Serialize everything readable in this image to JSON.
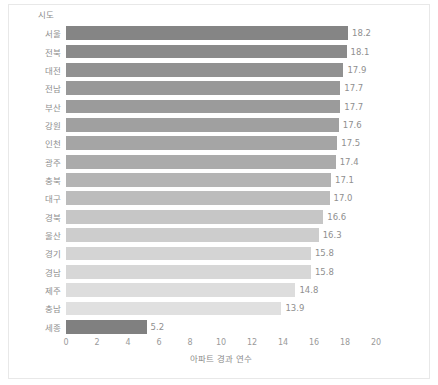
{
  "chart_data": {
    "type": "bar",
    "orientation": "horizontal",
    "title": "",
    "ylabel": "시도",
    "xlabel": "아파트 경과 연수",
    "xlim": [
      0,
      20
    ],
    "xticks": [
      0,
      2,
      4,
      6,
      8,
      10,
      12,
      14,
      16,
      18,
      20
    ],
    "xtick_labels": [
      "0",
      "2",
      "4",
      "6",
      "8",
      "10",
      "12",
      "14",
      "16",
      "18",
      "20"
    ],
    "grid": false,
    "legend": false,
    "categories": [
      "서울",
      "전북",
      "대전",
      "전남",
      "부산",
      "강원",
      "인천",
      "광주",
      "충북",
      "대구",
      "경북",
      "울산",
      "경기",
      "경남",
      "제주",
      "충남",
      "세종"
    ],
    "values": [
      18.2,
      18.1,
      17.9,
      17.7,
      17.7,
      17.6,
      17.5,
      17.4,
      17.1,
      17.0,
      16.6,
      16.3,
      15.8,
      15.8,
      14.8,
      13.9,
      5.2
    ],
    "value_labels": [
      "18.2",
      "18.1",
      "17.9",
      "17.7",
      "17.7",
      "17.6",
      "17.5",
      "17.4",
      "17.1",
      "17.0",
      "16.6",
      "16.3",
      "15.8",
      "15.8",
      "14.8",
      "13.9",
      "5.2"
    ],
    "bar_colors": [
      "#858585",
      "#8a8a8a",
      "#919191",
      "#989898",
      "#9b9b9b",
      "#a0a0a0",
      "#a5a5a5",
      "#ababab",
      "#b4b4b4",
      "#bcbcbc",
      "#c6c6c6",
      "#cdcdcd",
      "#d4d4d4",
      "#d7d7d7",
      "#dddddd",
      "#e0e0e0",
      "#808080"
    ]
  },
  "colors": {
    "background": "#ffffff",
    "frame": "#e8e8e8",
    "axis_text": "#8f8f8f",
    "tick_text": "#9a9a9a"
  }
}
